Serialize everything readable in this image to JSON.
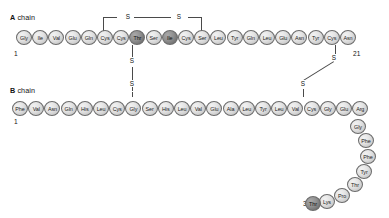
{
  "figure": {
    "type": "protein-sequence-diagram"
  },
  "chains": {
    "a": {
      "label_bold": "A",
      "label_rest": " chain",
      "start_number": "1",
      "end_number": "21",
      "residues": [
        {
          "name": "Gly",
          "shade": "light"
        },
        {
          "name": "Ile",
          "shade": "light"
        },
        {
          "name": "Val",
          "shade": "light"
        },
        {
          "name": "Glu",
          "shade": "light"
        },
        {
          "name": "Gln",
          "shade": "light"
        },
        {
          "name": "Cys",
          "shade": "light"
        },
        {
          "name": "Cys",
          "shade": "light"
        },
        {
          "name": "Thr",
          "shade": "dark"
        },
        {
          "name": "Ser",
          "shade": "light"
        },
        {
          "name": "Ile",
          "shade": "dark"
        },
        {
          "name": "Cys",
          "shade": "light"
        },
        {
          "name": "Ser",
          "shade": "light"
        },
        {
          "name": "Leu",
          "shade": "light"
        },
        {
          "name": "Tyr",
          "shade": "light"
        },
        {
          "name": "Gln",
          "shade": "light"
        },
        {
          "name": "Leu",
          "shade": "light"
        },
        {
          "name": "Glu",
          "shade": "light"
        },
        {
          "name": "Asn",
          "shade": "light"
        },
        {
          "name": "Tyr",
          "shade": "light"
        },
        {
          "name": "Cys",
          "shade": "light"
        },
        {
          "name": "Asn",
          "shade": "light"
        }
      ]
    },
    "b": {
      "label_bold": "B",
      "label_rest": " chain",
      "start_number": "1",
      "end_number": "30",
      "residues": [
        {
          "name": "Phe",
          "shade": "light"
        },
        {
          "name": "Val",
          "shade": "light"
        },
        {
          "name": "Asn",
          "shade": "light"
        },
        {
          "name": "Gln",
          "shade": "light"
        },
        {
          "name": "His",
          "shade": "light"
        },
        {
          "name": "Leu",
          "shade": "light"
        },
        {
          "name": "Cys",
          "shade": "light"
        },
        {
          "name": "Gly",
          "shade": "light"
        },
        {
          "name": "Ser",
          "shade": "light"
        },
        {
          "name": "His",
          "shade": "light"
        },
        {
          "name": "Leu",
          "shade": "light"
        },
        {
          "name": "Val",
          "shade": "light"
        },
        {
          "name": "Glu",
          "shade": "light"
        },
        {
          "name": "Ala",
          "shade": "light"
        },
        {
          "name": "Leu",
          "shade": "light"
        },
        {
          "name": "Tyr",
          "shade": "light"
        },
        {
          "name": "Leu",
          "shade": "light"
        },
        {
          "name": "Val",
          "shade": "light"
        },
        {
          "name": "Cys",
          "shade": "light"
        },
        {
          "name": "Gly",
          "shade": "light"
        },
        {
          "name": "Glu",
          "shade": "light"
        },
        {
          "name": "Arg",
          "shade": "light"
        },
        {
          "name": "Gly",
          "shade": "light"
        },
        {
          "name": "Phe",
          "shade": "light"
        },
        {
          "name": "Phe",
          "shade": "light"
        },
        {
          "name": "Tyr",
          "shade": "light"
        },
        {
          "name": "Thr",
          "shade": "light"
        },
        {
          "name": "Pro",
          "shade": "light"
        },
        {
          "name": "Lys",
          "shade": "light"
        },
        {
          "name": "Thr",
          "shade": "dark"
        }
      ]
    }
  },
  "disulfide_bonds": [
    {
      "id": "a6-a11",
      "label_left": "S",
      "label_right": "S",
      "kind": "intrachain-a"
    },
    {
      "id": "a7-b7",
      "label_top": "S",
      "label_bottom": "S",
      "kind": "interchain"
    },
    {
      "id": "a20-b19",
      "label_top": "S",
      "label_bottom": "S",
      "kind": "interchain"
    }
  ],
  "colors": {
    "background": "#ffffff",
    "residue_light": "#e0e0e0",
    "residue_dark": "#8f8f8f",
    "stroke": "#6b6b6b",
    "text": "#111111",
    "bond": "#4a4a4a"
  }
}
